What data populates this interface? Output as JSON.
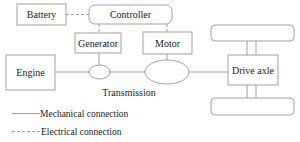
{
  "diagram": {
    "type": "block-diagram",
    "nodes": {
      "battery": "Battery",
      "controller": "Controller",
      "generator": "Generator",
      "motor": "Motor",
      "engine": "Engine",
      "drive_axle": "Drive axle",
      "transmission": "Transmission"
    },
    "legend": {
      "mechanical": "Mechanical connection",
      "electrical": "Electrical connection"
    },
    "edges": [
      {
        "from": "Battery",
        "to": "Controller",
        "style": "electrical"
      },
      {
        "from": "Controller",
        "to": "Generator",
        "style": "electrical"
      },
      {
        "from": "Controller",
        "to": "Motor",
        "style": "electrical"
      },
      {
        "from": "Engine",
        "to": "Transmission (small gear)",
        "style": "mechanical"
      },
      {
        "from": "Generator",
        "to": "Transmission (small gear)",
        "style": "mechanical"
      },
      {
        "from": "Transmission (small gear)",
        "to": "Transmission (large gear)",
        "style": "mechanical"
      },
      {
        "from": "Motor",
        "to": "Transmission (large gear)",
        "style": "mechanical"
      },
      {
        "from": "Transmission (large gear)",
        "to": "Drive axle",
        "style": "mechanical"
      },
      {
        "from": "Drive axle",
        "to": "Wheel (top)",
        "style": "mechanical"
      },
      {
        "from": "Drive axle",
        "to": "Wheel (bottom)",
        "style": "mechanical"
      }
    ],
    "colors": {
      "stroke": "#8a8a8a",
      "text": "#222222",
      "background": "#ffffff"
    }
  }
}
